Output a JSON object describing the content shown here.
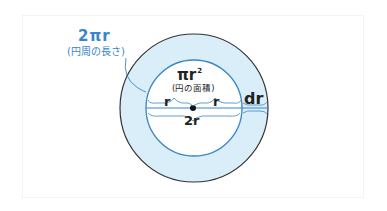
{
  "diagram": {
    "circumference": {
      "formula": "2πr",
      "caption": "(円周の長さ)"
    },
    "area": {
      "formula": "πr",
      "exponent": "2",
      "caption": "(円の面積)"
    },
    "radius_left": "r",
    "radius_right": "r",
    "diameter": "2r",
    "thickness": "dr",
    "colors": {
      "ring_fill": "#d9eef8",
      "inner_circle_stroke": "#3a86c8",
      "outer_circle_stroke": "#333333",
      "accent_text": "#3a86c8",
      "text": "#222222"
    }
  }
}
